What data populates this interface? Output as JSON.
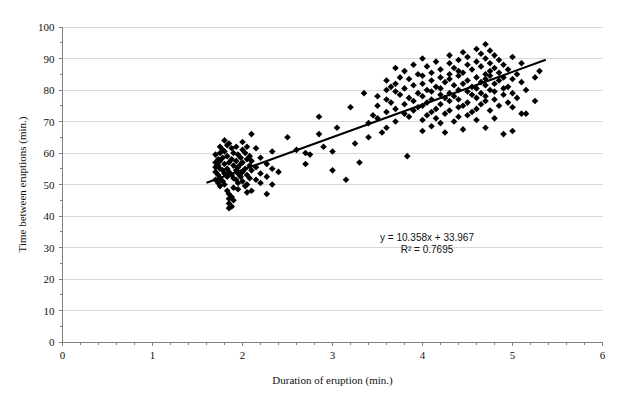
{
  "chart_data": {
    "type": "scatter",
    "title": "",
    "xlabel": "Duration of eruption (min.)",
    "ylabel": "Time between eruptions (min.)",
    "xlim": [
      0,
      6
    ],
    "ylim": [
      0,
      100
    ],
    "xticks": [
      0,
      1,
      2,
      3,
      4,
      5,
      6
    ],
    "yticks": [
      0,
      10,
      20,
      30,
      40,
      50,
      60,
      70,
      80,
      90,
      100
    ],
    "xtick_labels": [
      "0",
      "1",
      "2",
      "3",
      "4",
      "5",
      "6"
    ],
    "ytick_labels": [
      "0",
      "10",
      "20",
      "30",
      "40",
      "50",
      "60",
      "70",
      "80",
      "90",
      "100"
    ],
    "minor_xticks_per_major": 5,
    "minor_yticks_per_major": 2,
    "grid": "horizontal",
    "grid_color": "#d9d9d9",
    "marker": "diamond",
    "marker_color": "#000000",
    "marker_size": 4,
    "legend": "none",
    "trendline": {
      "type": "linear",
      "equation": "y = 10.358x + 33.967",
      "r2_label": "R² = 0.7695",
      "slope": 10.358,
      "intercept": 33.967,
      "r2": 0.7695,
      "x_start": 1.6,
      "x_end": 5.37,
      "color": "#000000"
    },
    "annotation": {
      "line1": "y = 10.358x + 33.967",
      "line2": "R² = 0.7695",
      "x": 4.05,
      "y": 32
    },
    "points": [
      [
        1.7,
        59.5
      ],
      [
        1.7,
        57.0
      ],
      [
        1.7,
        55.5
      ],
      [
        1.7,
        54.0
      ],
      [
        1.7,
        51.5
      ],
      [
        1.73,
        58.0
      ],
      [
        1.73,
        56.0
      ],
      [
        1.73,
        53.0
      ],
      [
        1.73,
        50.5
      ],
      [
        1.75,
        62.0
      ],
      [
        1.75,
        60.0
      ],
      [
        1.75,
        57.5
      ],
      [
        1.75,
        55.0
      ],
      [
        1.75,
        52.0
      ],
      [
        1.75,
        49.5
      ],
      [
        1.78,
        61.0
      ],
      [
        1.78,
        58.5
      ],
      [
        1.78,
        54.5
      ],
      [
        1.78,
        51.0
      ],
      [
        1.8,
        64.0
      ],
      [
        1.8,
        60.5
      ],
      [
        1.8,
        56.5
      ],
      [
        1.8,
        53.5
      ],
      [
        1.8,
        50.0
      ],
      [
        1.83,
        62.5
      ],
      [
        1.83,
        59.0
      ],
      [
        1.83,
        55.0
      ],
      [
        1.83,
        52.5
      ],
      [
        1.83,
        48.0
      ],
      [
        1.85,
        63.0
      ],
      [
        1.85,
        57.0
      ],
      [
        1.85,
        54.0
      ],
      [
        1.85,
        47.0
      ],
      [
        1.85,
        45.5
      ],
      [
        1.85,
        44.0
      ],
      [
        1.85,
        42.5
      ],
      [
        1.88,
        61.5
      ],
      [
        1.88,
        58.0
      ],
      [
        1.88,
        53.0
      ],
      [
        1.88,
        46.0
      ],
      [
        1.88,
        43.0
      ],
      [
        1.9,
        60.0
      ],
      [
        1.9,
        56.0
      ],
      [
        1.9,
        52.0
      ],
      [
        1.9,
        49.0
      ],
      [
        1.9,
        45.0
      ],
      [
        1.93,
        62.0
      ],
      [
        1.93,
        57.5
      ],
      [
        1.93,
        54.5
      ],
      [
        1.93,
        51.5
      ],
      [
        1.95,
        59.5
      ],
      [
        1.95,
        55.5
      ],
      [
        1.95,
        53.5
      ],
      [
        1.95,
        50.5
      ],
      [
        1.95,
        48.5
      ],
      [
        1.98,
        58.5
      ],
      [
        1.98,
        56.5
      ],
      [
        1.98,
        52.5
      ],
      [
        2.0,
        63.5
      ],
      [
        2.0,
        61.0
      ],
      [
        2.0,
        57.0
      ],
      [
        2.0,
        54.0
      ],
      [
        2.0,
        51.0
      ],
      [
        2.03,
        60.0
      ],
      [
        2.03,
        55.0
      ],
      [
        2.03,
        49.5
      ],
      [
        2.05,
        62.0
      ],
      [
        2.05,
        58.0
      ],
      [
        2.05,
        53.0
      ],
      [
        2.05,
        50.0
      ],
      [
        2.05,
        47.5
      ],
      [
        2.08,
        59.0
      ],
      [
        2.08,
        56.0
      ],
      [
        2.08,
        52.0
      ],
      [
        2.1,
        66.0
      ],
      [
        2.1,
        57.5
      ],
      [
        2.1,
        54.5
      ],
      [
        2.1,
        48.0
      ],
      [
        2.15,
        61.5
      ],
      [
        2.15,
        55.5
      ],
      [
        2.15,
        51.5
      ],
      [
        2.2,
        58.5
      ],
      [
        2.2,
        53.5
      ],
      [
        2.2,
        50.5
      ],
      [
        2.27,
        56.5
      ],
      [
        2.27,
        52.5
      ],
      [
        2.27,
        47.0
      ],
      [
        2.33,
        60.5
      ],
      [
        2.33,
        55.0
      ],
      [
        2.33,
        50.0
      ],
      [
        2.4,
        54.0
      ],
      [
        2.5,
        65.0
      ],
      [
        2.6,
        61.0
      ],
      [
        2.7,
        60.0
      ],
      [
        2.7,
        56.5
      ],
      [
        2.75,
        59.5
      ],
      [
        2.85,
        71.5
      ],
      [
        2.85,
        66.0
      ],
      [
        2.9,
        62.0
      ],
      [
        3.0,
        60.5
      ],
      [
        3.0,
        54.5
      ],
      [
        3.05,
        68.0
      ],
      [
        3.15,
        51.5
      ],
      [
        3.2,
        74.5
      ],
      [
        3.25,
        63.0
      ],
      [
        3.3,
        57.0
      ],
      [
        3.35,
        79.0
      ],
      [
        3.4,
        69.5
      ],
      [
        3.4,
        65.0
      ],
      [
        3.45,
        72.0
      ],
      [
        3.5,
        78.0
      ],
      [
        3.5,
        75.0
      ],
      [
        3.5,
        71.0
      ],
      [
        3.55,
        66.5
      ],
      [
        3.6,
        83.0
      ],
      [
        3.6,
        80.0
      ],
      [
        3.6,
        77.0
      ],
      [
        3.6,
        73.0
      ],
      [
        3.6,
        68.0
      ],
      [
        3.65,
        81.0
      ],
      [
        3.65,
        76.0
      ],
      [
        3.7,
        87.0
      ],
      [
        3.7,
        82.0
      ],
      [
        3.7,
        79.5
      ],
      [
        3.7,
        74.0
      ],
      [
        3.7,
        70.0
      ],
      [
        3.75,
        84.0
      ],
      [
        3.75,
        78.5
      ],
      [
        3.8,
        86.0
      ],
      [
        3.8,
        80.5
      ],
      [
        3.8,
        75.5
      ],
      [
        3.8,
        72.5
      ],
      [
        3.83,
        59.0
      ],
      [
        3.85,
        83.5
      ],
      [
        3.85,
        77.5
      ],
      [
        3.85,
        71.5
      ],
      [
        3.9,
        88.0
      ],
      [
        3.9,
        81.5
      ],
      [
        3.9,
        76.5
      ],
      [
        3.9,
        73.5
      ],
      [
        3.95,
        85.0
      ],
      [
        3.95,
        79.0
      ],
      [
        3.95,
        74.5
      ],
      [
        4.0,
        90.0
      ],
      [
        4.0,
        84.5
      ],
      [
        4.0,
        82.0
      ],
      [
        4.0,
        78.0
      ],
      [
        4.0,
        75.0
      ],
      [
        4.0,
        70.5
      ],
      [
        4.0,
        67.0
      ],
      [
        4.05,
        87.5
      ],
      [
        4.05,
        80.0
      ],
      [
        4.05,
        76.0
      ],
      [
        4.05,
        72.0
      ],
      [
        4.1,
        85.5
      ],
      [
        4.1,
        83.0
      ],
      [
        4.1,
        79.5
      ],
      [
        4.1,
        77.0
      ],
      [
        4.1,
        73.0
      ],
      [
        4.1,
        68.5
      ],
      [
        4.15,
        89.0
      ],
      [
        4.15,
        81.0
      ],
      [
        4.15,
        74.0
      ],
      [
        4.15,
        71.0
      ],
      [
        4.2,
        86.5
      ],
      [
        4.2,
        84.0
      ],
      [
        4.2,
        80.5
      ],
      [
        4.2,
        78.5
      ],
      [
        4.2,
        75.5
      ],
      [
        4.2,
        69.5
      ],
      [
        4.25,
        82.5
      ],
      [
        4.25,
        77.5
      ],
      [
        4.25,
        72.5
      ],
      [
        4.25,
        66.5
      ],
      [
        4.3,
        91.0
      ],
      [
        4.3,
        88.5
      ],
      [
        4.3,
        85.0
      ],
      [
        4.3,
        83.5
      ],
      [
        4.3,
        79.0
      ],
      [
        4.3,
        76.5
      ],
      [
        4.3,
        73.5
      ],
      [
        4.35,
        87.0
      ],
      [
        4.35,
        81.5
      ],
      [
        4.35,
        78.0
      ],
      [
        4.35,
        70.0
      ],
      [
        4.4,
        89.5
      ],
      [
        4.4,
        86.0
      ],
      [
        4.4,
        84.5
      ],
      [
        4.4,
        80.0
      ],
      [
        4.4,
        77.0
      ],
      [
        4.4,
        74.5
      ],
      [
        4.4,
        71.5
      ],
      [
        4.45,
        92.0
      ],
      [
        4.45,
        85.5
      ],
      [
        4.45,
        82.0
      ],
      [
        4.45,
        75.0
      ],
      [
        4.45,
        67.5
      ],
      [
        4.5,
        90.5
      ],
      [
        4.5,
        88.0
      ],
      [
        4.5,
        83.0
      ],
      [
        4.5,
        79.5
      ],
      [
        4.5,
        76.0
      ],
      [
        4.5,
        72.0
      ],
      [
        4.55,
        86.5
      ],
      [
        4.55,
        81.0
      ],
      [
        4.55,
        78.5
      ],
      [
        4.55,
        73.0
      ],
      [
        4.6,
        93.0
      ],
      [
        4.6,
        89.0
      ],
      [
        4.6,
        84.0
      ],
      [
        4.6,
        80.5
      ],
      [
        4.6,
        77.5
      ],
      [
        4.6,
        74.0
      ],
      [
        4.6,
        70.5
      ],
      [
        4.65,
        91.5
      ],
      [
        4.65,
        87.5
      ],
      [
        4.65,
        82.5
      ],
      [
        4.65,
        79.0
      ],
      [
        4.65,
        75.5
      ],
      [
        4.7,
        94.5
      ],
      [
        4.7,
        90.0
      ],
      [
        4.7,
        85.0
      ],
      [
        4.7,
        83.5
      ],
      [
        4.7,
        81.5
      ],
      [
        4.7,
        78.0
      ],
      [
        4.7,
        76.5
      ],
      [
        4.7,
        68.0
      ],
      [
        4.75,
        92.5
      ],
      [
        4.75,
        88.5
      ],
      [
        4.75,
        86.0
      ],
      [
        4.75,
        84.5
      ],
      [
        4.75,
        80.0
      ],
      [
        4.75,
        73.5
      ],
      [
        4.8,
        91.0
      ],
      [
        4.8,
        87.0
      ],
      [
        4.8,
        82.0
      ],
      [
        4.8,
        79.5
      ],
      [
        4.8,
        77.0
      ],
      [
        4.8,
        71.0
      ],
      [
        4.85,
        89.5
      ],
      [
        4.85,
        85.5
      ],
      [
        4.85,
        83.0
      ],
      [
        4.85,
        75.0
      ],
      [
        4.9,
        88.0
      ],
      [
        4.9,
        84.0
      ],
      [
        4.9,
        80.5
      ],
      [
        4.9,
        78.5
      ],
      [
        4.9,
        66.0
      ],
      [
        4.95,
        86.5
      ],
      [
        4.95,
        81.0
      ],
      [
        4.95,
        76.0
      ],
      [
        5.0,
        90.5
      ],
      [
        5.0,
        83.5
      ],
      [
        5.0,
        79.0
      ],
      [
        5.0,
        74.5
      ],
      [
        5.0,
        67.0
      ],
      [
        5.05,
        85.0
      ],
      [
        5.05,
        77.5
      ],
      [
        5.1,
        88.5
      ],
      [
        5.1,
        82.5
      ],
      [
        5.1,
        72.5
      ],
      [
        5.15,
        80.0
      ],
      [
        5.15,
        72.5
      ],
      [
        5.25,
        84.0
      ],
      [
        5.25,
        76.5
      ],
      [
        5.3,
        86.0
      ]
    ]
  }
}
